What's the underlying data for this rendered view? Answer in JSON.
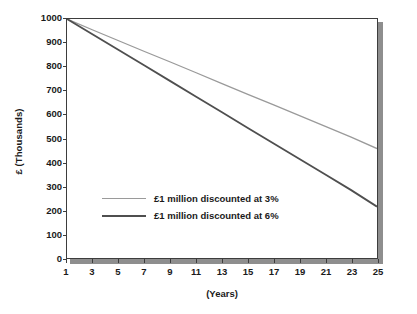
{
  "chart_data": {
    "type": "line",
    "title": "",
    "xlabel": "(Years)",
    "ylabel": "£ (Thousands)",
    "xlim": [
      1,
      25
    ],
    "ylim": [
      0,
      1000
    ],
    "grid": false,
    "legend_position": "center-left",
    "x_ticks": [
      1,
      3,
      5,
      7,
      9,
      11,
      13,
      15,
      17,
      19,
      21,
      23,
      25
    ],
    "x_tick_labels": [
      "1",
      "3",
      "5",
      "7",
      "9",
      "11",
      "13",
      "15",
      "17",
      "19",
      "21",
      "23",
      "25"
    ],
    "y_ticks": [
      0,
      100,
      200,
      300,
      400,
      500,
      600,
      700,
      800,
      900,
      1000
    ],
    "y_tick_labels": [
      "0",
      "100",
      "200",
      "300",
      "400",
      "500",
      "600",
      "700",
      "800",
      "900",
      "1000"
    ],
    "x": [
      1,
      3,
      5,
      7,
      9,
      11,
      13,
      15,
      17,
      19,
      21,
      23,
      25
    ],
    "series": [
      {
        "name": "£1 million discounted at 3%",
        "color": "#9a9a9a",
        "values": [
          1000,
          954,
          909,
          864,
          820,
          775,
          730,
          685,
          641,
          596,
          551,
          506,
          458
        ]
      },
      {
        "name": "£1 million discounted at 6%",
        "color": "#4f4f4f",
        "values": [
          1000,
          935,
          870,
          805,
          740,
          675,
          610,
          544,
          479,
          414,
          349,
          284,
          215
        ]
      }
    ]
  },
  "legend": {
    "entries": [
      {
        "label": "£1 million discounted at 3%"
      },
      {
        "label": "£1 million discounted at 6%"
      }
    ]
  },
  "axes": {
    "y_title": "£ (Thousands)",
    "x_title": "(Years)"
  },
  "colors": {
    "series_3pct": "#9a9a9a",
    "series_6pct": "#4f4f4f",
    "frame": "#3d3d3d",
    "shadow": "#8e8e8e",
    "text": "#1a1a1a",
    "background": "#ffffff"
  }
}
